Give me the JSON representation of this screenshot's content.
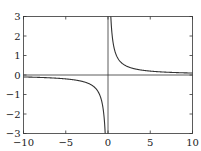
{
  "chart_data": {
    "type": "line",
    "title": "",
    "xlabel": "",
    "ylabel": "",
    "xlim": [
      -10,
      10
    ],
    "ylim": [
      -3,
      3
    ],
    "grid": false,
    "legend": null,
    "xticks": [
      -10,
      -5,
      0,
      5,
      10
    ],
    "yticks": [
      -3,
      -2,
      -1,
      0,
      1,
      2,
      3
    ],
    "xtick_labels": [
      "−10",
      "−5",
      "0",
      "5",
      "10"
    ],
    "ytick_labels": [
      "−3",
      "−2",
      "−1",
      "0",
      "1",
      "2",
      "3"
    ],
    "reference_lines": [
      {
        "orientation": "horizontal",
        "value": 0
      },
      {
        "orientation": "vertical",
        "value": 0
      }
    ],
    "series": [
      {
        "name": "y = 1/x",
        "function": "1/x",
        "segments": [
          {
            "x": [
              -10,
              -8,
              -6,
              -5,
              -4,
              -3,
              -2,
              -1.5,
              -1,
              -0.75,
              -0.5,
              -0.4,
              -0.333
            ],
            "y": [
              -0.1,
              -0.125,
              -0.167,
              -0.2,
              -0.25,
              -0.333,
              -0.5,
              -0.667,
              -1,
              -1.333,
              -2,
              -2.5,
              -3
            ]
          },
          {
            "x": [
              0.333,
              0.4,
              0.5,
              0.75,
              1,
              1.5,
              2,
              3,
              4,
              5,
              6,
              8,
              10
            ],
            "y": [
              3,
              2.5,
              2,
              1.333,
              1,
              0.667,
              0.5,
              0.333,
              0.25,
              0.2,
              0.167,
              0.125,
              0.1
            ]
          }
        ],
        "color": "#333333"
      }
    ]
  }
}
